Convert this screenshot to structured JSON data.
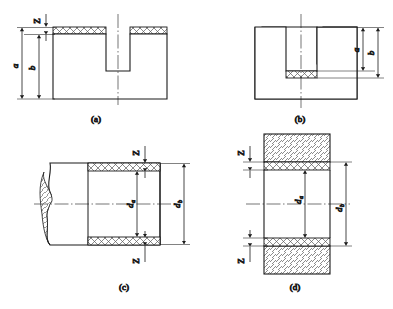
{
  "figure": {
    "stroke_color": "#1a1a1a",
    "hatch_color": "#5a5a5a",
    "background": "#ffffff",
    "panels": [
      {
        "id": "a",
        "caption": "(a)",
        "description": "Slotted block, coating on top faces",
        "labels": {
          "thickness": "Z",
          "dim_outer": "a",
          "dim_inner": "b"
        }
      },
      {
        "id": "b",
        "caption": "(b)",
        "description": "Inverted slotted block, coating on slot floor",
        "labels": {
          "dim_inner": "a",
          "dim_outer": "b"
        }
      },
      {
        "id": "c",
        "caption": "(c)",
        "description": "Shaft with break line, coating on outer cylindrical surface",
        "labels": {
          "thickness_top": "Z",
          "thickness_bottom": "Z",
          "dim_inner": "d",
          "dim_inner_sub": "a",
          "dim_outer": "d",
          "dim_outer_sub": "b"
        }
      },
      {
        "id": "d",
        "caption": "(d)",
        "description": "Bore section, coating on inner bore surface",
        "labels": {
          "thickness_top": "Z",
          "thickness_bottom": "Z",
          "dim_inner": "d",
          "dim_inner_sub": "a",
          "dim_outer": "d",
          "dim_outer_sub": "b"
        }
      }
    ]
  }
}
